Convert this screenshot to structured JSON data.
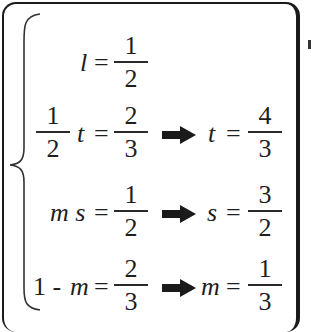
{
  "figure": {
    "type": "system-of-equations",
    "brace": "left-curly",
    "equations": [
      {
        "lhs": {
          "variable": "l"
        },
        "rhs": {
          "num": "1",
          "den": "2"
        },
        "result": null
      },
      {
        "lhs": {
          "coef": {
            "num": "1",
            "den": "2"
          },
          "variable": "t"
        },
        "rhs": {
          "num": "2",
          "den": "3"
        },
        "result": {
          "variable": "t",
          "num": "4",
          "den": "3"
        }
      },
      {
        "lhs": {
          "variable": "m s"
        },
        "rhs": {
          "num": "1",
          "den": "2"
        },
        "result": {
          "variable": "s",
          "num": "3",
          "den": "2"
        }
      },
      {
        "lhs": {
          "prefix": "1 -",
          "variable": "m"
        },
        "rhs": {
          "num": "2",
          "den": "3"
        },
        "result": {
          "variable": "m",
          "num": "1",
          "den": "3"
        }
      }
    ],
    "symbols": {
      "equals": "=",
      "arrow": "implies-arrow"
    },
    "colors": {
      "ink": "#1e1e1e",
      "background": "#ffffff",
      "frame": "#1a1a1a"
    }
  }
}
